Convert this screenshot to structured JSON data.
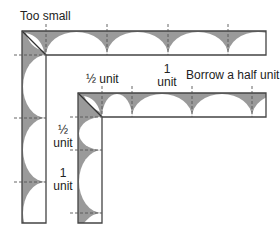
{
  "labels": {
    "too_small": "Too small",
    "half_unit_top": "½ unit",
    "one_unit_top_num": "1",
    "one_unit_top_word": "unit",
    "borrow": "Borrow a half unit.",
    "half_unit_left_num": "½",
    "half_unit_left_word": "unit",
    "one_unit_left_num": "1",
    "one_unit_left_word": "unit"
  },
  "colors": {
    "fill": "#9a9a9a",
    "outline": "#444444",
    "dash": "#555555",
    "background": "#ffffff"
  },
  "diagram": {
    "outer_border": {
      "corner": [
        22,
        31
      ],
      "inner_corner": [
        46,
        55
      ],
      "right": 266,
      "bottom": 223,
      "top_cusps_x": [
        46,
        107,
        168,
        228
      ],
      "left_cusps_y": [
        55,
        118,
        182
      ]
    },
    "inner_border": {
      "corner": [
        78,
        93
      ],
      "inner_corner": [
        102,
        117
      ],
      "right": 266,
      "bottom": 223,
      "top_cusps_x": [
        102,
        132,
        192,
        252
      ],
      "left_cusps_y": [
        117,
        150,
        213
      ]
    }
  }
}
